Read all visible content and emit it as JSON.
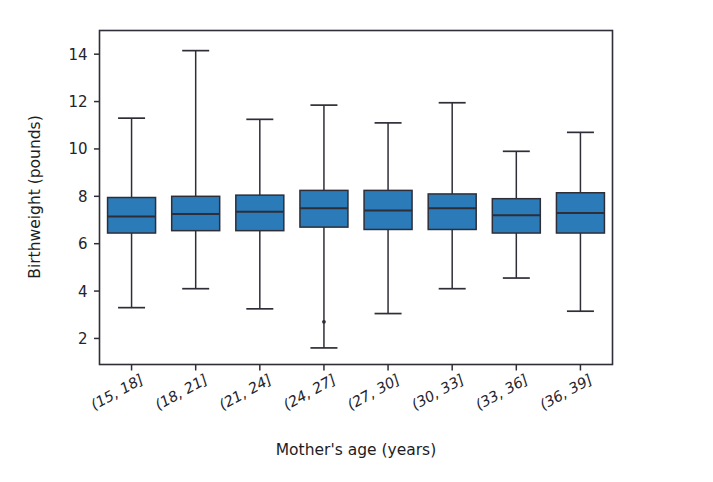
{
  "chart_data": {
    "type": "box",
    "title": "",
    "xlabel": "Mother's age (years)",
    "ylabel": "Birthweight (pounds)",
    "categories": [
      "(15, 18]",
      "(18, 21]",
      "(21, 24]",
      "(24, 27]",
      "(27, 30]",
      "(30, 33]",
      "(33, 36]",
      "(36, 39]"
    ],
    "yticks": [
      2,
      4,
      6,
      8,
      10,
      12,
      14
    ],
    "ytick_labels": [
      "2",
      "4",
      "6",
      "8",
      "10",
      "12",
      "14"
    ],
    "ylim": [
      0.9,
      15.0
    ],
    "grid": false,
    "legend": null,
    "box_fill_color": "#2b7bb9",
    "line_color": "#2e2e38",
    "boxes": [
      {
        "category": "(15, 18]",
        "whisker_low": 3.3,
        "q1": 6.45,
        "median": 7.15,
        "q3": 7.95,
        "whisker_high": 11.3,
        "fliers": []
      },
      {
        "category": "(18, 21]",
        "whisker_low": 4.1,
        "q1": 6.55,
        "median": 7.25,
        "q3": 8.0,
        "whisker_high": 14.15,
        "fliers": []
      },
      {
        "category": "(21, 24]",
        "whisker_low": 3.25,
        "q1": 6.55,
        "median": 7.35,
        "q3": 8.05,
        "whisker_high": 11.25,
        "fliers": []
      },
      {
        "category": "(24, 27]",
        "whisker_low": 1.6,
        "q1": 6.7,
        "median": 7.5,
        "q3": 8.25,
        "whisker_high": 11.85,
        "fliers": [
          2.7
        ]
      },
      {
        "category": "(27, 30]",
        "whisker_low": 3.05,
        "q1": 6.6,
        "median": 7.4,
        "q3": 8.25,
        "whisker_high": 11.1,
        "fliers": []
      },
      {
        "category": "(30, 33]",
        "whisker_low": 4.1,
        "q1": 6.6,
        "median": 7.5,
        "q3": 8.1,
        "whisker_high": 11.95,
        "fliers": []
      },
      {
        "category": "(33, 36]",
        "whisker_low": 4.55,
        "q1": 6.45,
        "median": 7.2,
        "q3": 7.9,
        "whisker_high": 9.9,
        "fliers": []
      },
      {
        "category": "(36, 39]",
        "whisker_low": 3.15,
        "q1": 6.45,
        "median": 7.3,
        "q3": 8.15,
        "whisker_high": 10.7,
        "fliers": []
      }
    ]
  },
  "axes": {
    "ylabel": "Birthweight (pounds)",
    "xlabel": "Mother's age (years)"
  }
}
